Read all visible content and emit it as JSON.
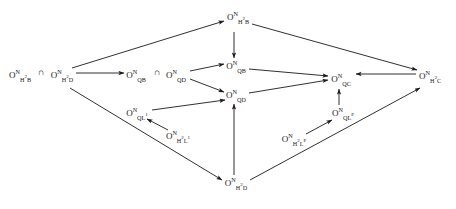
{
  "diagram": {
    "kind": "commutative-diagram",
    "width": 456,
    "height": 209,
    "background": "#ffffff",
    "ink": "#1a1a1a",
    "nodes": [
      {
        "id": "n-h2b-left",
        "label": "O^N_{H^2 B}",
        "base": "O",
        "sup": "N",
        "sub": "H",
        "sub_sup": "2",
        "sub_tail": "B",
        "x": 20,
        "y": 75
      },
      {
        "id": "n-h2d-left",
        "label": "O^N_{H^2 D}",
        "base": "O",
        "sup": "N",
        "sub": "H",
        "sub_sup": "2",
        "sub_tail": "D",
        "x": 62,
        "y": 75
      },
      {
        "id": "n-qb-left",
        "label": "O^N_{QB}",
        "base": "O",
        "sup": "N",
        "sub": "QB",
        "sub_sup": "",
        "sub_tail": "",
        "x": 136,
        "y": 75
      },
      {
        "id": "n-qd-left",
        "label": "O^N_{QD}",
        "base": "O",
        "sup": "N",
        "sub": "QD",
        "sub_sup": "",
        "sub_tail": "",
        "x": 176,
        "y": 75
      },
      {
        "id": "n-h2b-top",
        "label": "O^N_{H^2 B}",
        "base": "O",
        "sup": "N",
        "sub": "H",
        "sub_sup": "2",
        "sub_tail": "B",
        "x": 238,
        "y": 17
      },
      {
        "id": "n-qb",
        "label": "O^N_{QB}",
        "base": "O",
        "sup": "N",
        "sub": "QB",
        "sub_sup": "",
        "sub_tail": "",
        "x": 236,
        "y": 66
      },
      {
        "id": "n-qd",
        "label": "O^N_{QD}",
        "base": "O",
        "sup": "N",
        "sub": "QD",
        "sub_sup": "",
        "sub_tail": "",
        "x": 236,
        "y": 95
      },
      {
        "id": "n-ql1",
        "label": "O^N_{QL^1}",
        "base": "O",
        "sup": "N",
        "sub": "QL",
        "sub_sup": "1",
        "sub_tail": "",
        "x": 137,
        "y": 113
      },
      {
        "id": "n-h2l1",
        "label": "O^N_{H^2 L^1}",
        "base": "O",
        "sup": "N",
        "sub": "H",
        "sub_sup": "2",
        "sub_tail": "L",
        "sub_tail_sup": "1",
        "x": 178,
        "y": 136
      },
      {
        "id": "n-qc",
        "label": "O^N_{QC}",
        "base": "O",
        "sup": "N",
        "sub": "QC",
        "sub_sup": "",
        "sub_tail": "",
        "x": 341,
        "y": 79
      },
      {
        "id": "n-qlp",
        "label": "O^N_{QL^P}",
        "base": "O",
        "sup": "N",
        "sub": "QL",
        "sub_sup": "P",
        "sub_tail": "",
        "x": 343,
        "y": 113
      },
      {
        "id": "n-h2lp",
        "label": "O^N_{H^2 L^P}",
        "base": "O",
        "sup": "N",
        "sub": "H",
        "sub_sup": "2",
        "sub_tail": "L",
        "sub_tail_sup": "P",
        "x": 294,
        "y": 139
      },
      {
        "id": "n-h2c",
        "label": "O^N_{H^2 C}",
        "base": "O",
        "sup": "N",
        "sub": "H",
        "sub_sup": "2",
        "sub_tail": "C",
        "x": 430,
        "y": 76
      },
      {
        "id": "n-h2d-bot",
        "label": "O^N_{H^2 D}",
        "base": "O",
        "sup": "N",
        "sub": "H",
        "sub_sup": "2",
        "sub_tail": "D",
        "x": 236,
        "y": 183
      }
    ],
    "intersections": [
      {
        "id": "cap-left",
        "symbol": "∩",
        "x": 41,
        "y": 72
      },
      {
        "id": "cap-middle",
        "symbol": "∩",
        "x": 157,
        "y": 72
      }
    ],
    "edges": [
      {
        "id": "e-h2d-left-to-h2b-top",
        "from": "n-h2d-left",
        "to": "n-h2b-top",
        "x1": 72,
        "y1": 68,
        "x2": 224,
        "y2": 21
      },
      {
        "id": "e-h2d-left-to-qb-left",
        "from": "n-h2d-left",
        "to": "n-qb-left",
        "x1": 76,
        "y1": 73,
        "x2": 124,
        "y2": 73
      },
      {
        "id": "e-h2d-left-to-h2d-bot",
        "from": "n-h2d-left",
        "to": "n-h2d-bot",
        "x1": 70,
        "y1": 88,
        "x2": 222,
        "y2": 180
      },
      {
        "id": "e-h2b-top-to-qb",
        "from": "n-h2b-top",
        "to": "n-qb",
        "x1": 234,
        "y1": 32,
        "x2": 234,
        "y2": 58
      },
      {
        "id": "e-h2b-top-to-h2c",
        "from": "n-h2b-top",
        "to": "n-h2c",
        "x1": 252,
        "y1": 24,
        "x2": 417,
        "y2": 70
      },
      {
        "id": "e-qd-left-to-qb",
        "from": "n-qd-left",
        "to": "n-qb",
        "x1": 190,
        "y1": 71,
        "x2": 224,
        "y2": 64
      },
      {
        "id": "e-qd-left-to-qd",
        "from": "n-qd-left",
        "to": "n-qd",
        "x1": 190,
        "y1": 79,
        "x2": 224,
        "y2": 92
      },
      {
        "id": "e-qb-to-qc",
        "from": "n-qb",
        "to": "n-qc",
        "x1": 249,
        "y1": 69,
        "x2": 328,
        "y2": 76
      },
      {
        "id": "e-qd-to-qc",
        "from": "n-qd",
        "to": "n-qc",
        "x1": 249,
        "y1": 93,
        "x2": 328,
        "y2": 80
      },
      {
        "id": "e-ql1-to-qd",
        "from": "n-ql1",
        "to": "n-qd",
        "x1": 152,
        "y1": 110,
        "x2": 225,
        "y2": 100
      },
      {
        "id": "e-h2l1-to-ql1",
        "from": "n-h2l1",
        "to": "n-ql1",
        "x1": 168,
        "y1": 130,
        "x2": 147,
        "y2": 119
      },
      {
        "id": "e-h2d-bot-to-qd",
        "from": "n-h2d-bot",
        "to": "n-qd",
        "x1": 234,
        "y1": 175,
        "x2": 234,
        "y2": 104
      },
      {
        "id": "e-h2d-bot-to-h2c",
        "from": "n-h2d-bot",
        "to": "n-h2c",
        "x1": 250,
        "y1": 180,
        "x2": 420,
        "y2": 88
      },
      {
        "id": "e-h2lp-to-qlp",
        "from": "n-h2lp",
        "to": "n-qlp",
        "x1": 306,
        "y1": 134,
        "x2": 332,
        "y2": 120
      },
      {
        "id": "e-qlp-to-qc",
        "from": "n-qlp",
        "to": "n-qc",
        "x1": 339,
        "y1": 105,
        "x2": 339,
        "y2": 89
      },
      {
        "id": "e-h2c-to-qc",
        "from": "n-h2c",
        "to": "n-qc",
        "x1": 416,
        "y1": 74,
        "x2": 356,
        "y2": 74
      }
    ]
  }
}
